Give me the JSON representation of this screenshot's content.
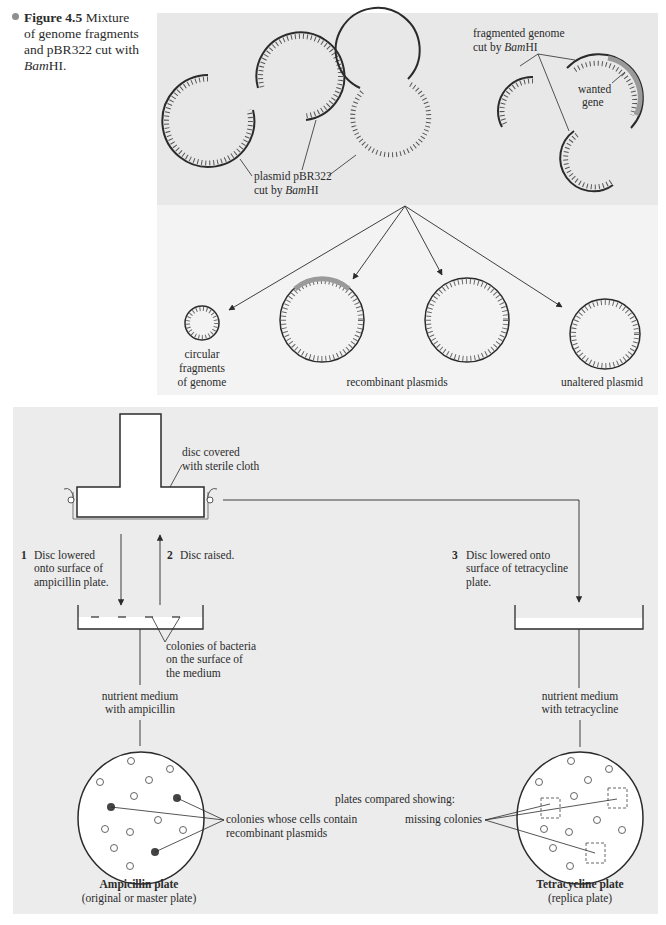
{
  "caption": {
    "figure_label": "Figure 4.5",
    "line1": "Mixture",
    "line2": "of genome fragments",
    "line3": "and pBR322 cut with",
    "line4_italic": "Bam",
    "line4_rest": "HI."
  },
  "top_panel": {
    "plasmid_label_line1": "plasmid pBR322",
    "plasmid_label_line2_prefix": "cut by ",
    "plasmid_label_line2_italic": "Bam",
    "plasmid_label_line2_suffix": "HI",
    "genome_label_line1": "fragmented genome",
    "genome_label_line2_prefix": "cut by ",
    "genome_label_line2_italic": "Bam",
    "genome_label_line2_suffix": "HI",
    "wanted_gene_line1": "wanted",
    "wanted_gene_line2": "gene"
  },
  "products_panel": {
    "circular_fragments_line1": "circular",
    "circular_fragments_line2": "fragments",
    "circular_fragments_line3": "of genome",
    "recombinant_label": "recombinant plasmids",
    "unaltered_label": "unaltered plasmid"
  },
  "replica_panel": {
    "disc_label_line1": "disc covered",
    "disc_label_line2": "with sterile cloth",
    "step1_number": "1",
    "step1_line1": "Disc lowered",
    "step1_line2": "onto surface of",
    "step1_line3": "ampicillin plate.",
    "step2_number": "2",
    "step2_text": "Disc raised.",
    "step3_number": "3",
    "step3_line1": "Disc lowered onto",
    "step3_line2": "surface of tetracycline",
    "step3_line3": "plate.",
    "colonies_line1": "colonies of bacteria",
    "colonies_line2": "on the surface of",
    "colonies_line3": "the medium",
    "medium_amp_line1": "nutrient medium",
    "medium_amp_line2": "with ampicillin",
    "medium_tet_line1": "nutrient medium",
    "medium_tet_line2": "with tetracycline",
    "recombinant_colonies_line1": "colonies whose cells contain",
    "recombinant_colonies_line2": "recombinant plasmids",
    "compared_label": "plates compared showing:",
    "missing_label": "missing colonies",
    "amp_plate_title": "Ampicillin plate",
    "amp_plate_sub": "(original or master plate)",
    "tet_plate_title": "Tetracycline plate",
    "tet_plate_sub": "(replica plate)"
  },
  "colors": {
    "top_panel_bg": "#e8e8e8",
    "products_panel_bg": "#f3f3f3",
    "replica_panel_bg": "#ececec",
    "ink": "#2b2b2b",
    "gene_highlight": "#9a9a9a"
  }
}
